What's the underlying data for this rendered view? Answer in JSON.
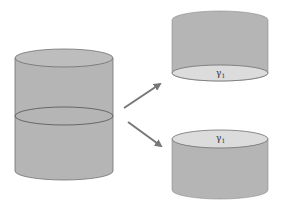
{
  "diagram": {
    "colors": {
      "body": "#b5b5b5",
      "body_stroke": "#6e6e6e",
      "cut_face": "#d9d9d9",
      "top_face": "#bdbdbd",
      "arrow": "#777777",
      "background": "#ffffff"
    },
    "source_cylinder": {
      "label": ""
    },
    "top_piece": {
      "cut_label": "γ",
      "cut_label_sub": "1"
    },
    "bottom_piece": {
      "cut_label": "γ",
      "cut_label_sub": "1"
    },
    "arrows": [
      {
        "name": "arrow-up-right",
        "from": [
          124,
          108
        ],
        "to": [
          160,
          84
        ]
      },
      {
        "name": "arrow-down-right",
        "from": [
          128,
          122
        ],
        "to": [
          161,
          146
        ]
      }
    ]
  }
}
